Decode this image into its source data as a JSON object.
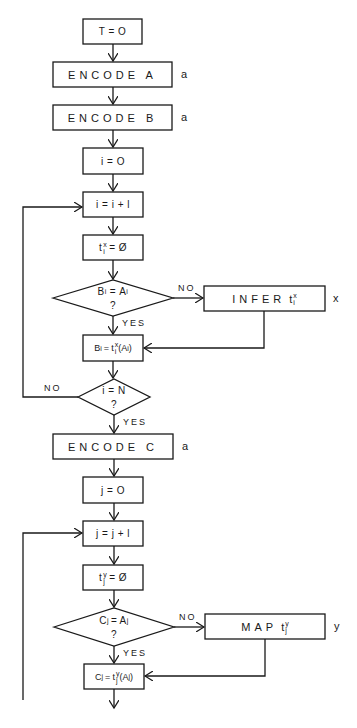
{
  "diagram": {
    "type": "flowchart",
    "nodes": {
      "t0": {
        "text": "T = O"
      },
      "encode_a": {
        "text": "ENCODE A",
        "side_label": "a"
      },
      "encode_b": {
        "text": "ENCODE B",
        "side_label": "a"
      },
      "i0": {
        "text": "i = O"
      },
      "i_inc": {
        "text": "i = i + l"
      },
      "tx_reset": {
        "base": "t",
        "sup": "x",
        "sub": "i",
        "rest": "= Ø"
      },
      "dec_b_eq_a": {
        "lhs_base": "B",
        "lhs_sub": "i",
        "op": "=",
        "rhs_base": "A",
        "rhs_sub": "i",
        "q": "?"
      },
      "infer": {
        "word": "INFER",
        "base": "t",
        "sup": "x",
        "sub": "i",
        "side_label": "x"
      },
      "assign_b": {
        "lhs_base": "B",
        "lhs_sub": "i",
        "op": "=",
        "fn": "t",
        "sup": "x",
        "sub": "i",
        "arg": "(A",
        "arg_sub": "i",
        "close": ")"
      },
      "dec_i_eq_n": {
        "text": "i = N",
        "q": "?"
      },
      "encode_c": {
        "text": "ENCODE C",
        "side_label": "a"
      },
      "j0": {
        "text": "j = O"
      },
      "j_inc": {
        "text": "j = j + l"
      },
      "ty_reset": {
        "base": "t",
        "sup": "y",
        "sub": "j",
        "rest": "= Ø"
      },
      "dec_c_eq_a": {
        "lhs_base": "C",
        "lhs_sub": "j",
        "op": "=",
        "rhs_base": "A",
        "rhs_sub": "j",
        "q": "?"
      },
      "map": {
        "word": "MAP",
        "base": "t",
        "sup": "y",
        "sub": "j",
        "side_label": "y"
      },
      "assign_c": {
        "lhs_base": "C",
        "lhs_sub": "j",
        "op": "=",
        "fn": "t",
        "sup": "y",
        "sub": "j",
        "arg": "(A",
        "arg_sub": "j",
        "close": ")"
      }
    },
    "edge_labels": {
      "no_1": "NO",
      "yes_1": "YES",
      "no_2": "NO",
      "yes_2": "YES",
      "no_3": "NO",
      "yes_3": "YES"
    },
    "colors": {
      "stroke": "#1a1a1a",
      "background": "#ffffff"
    }
  }
}
